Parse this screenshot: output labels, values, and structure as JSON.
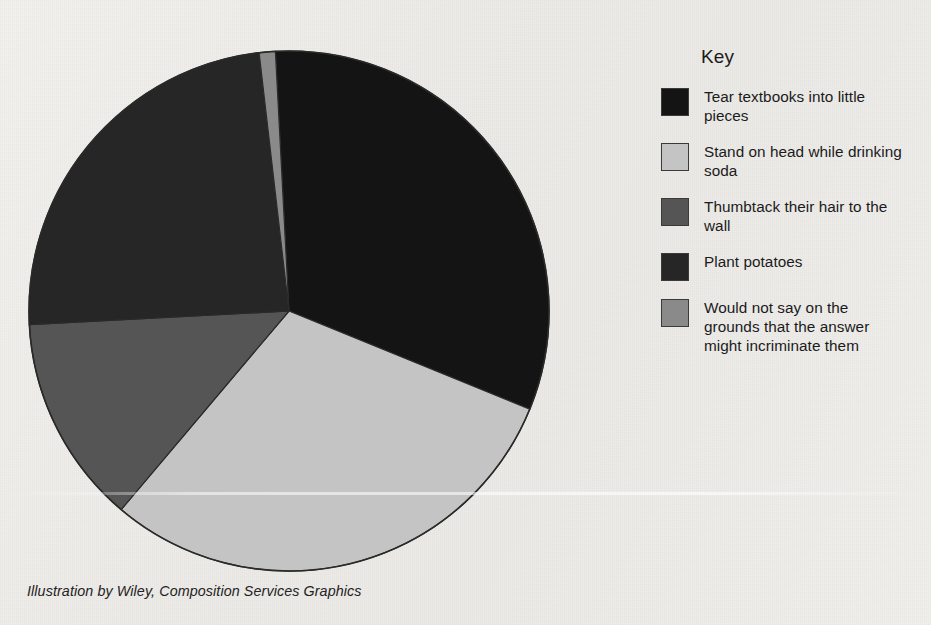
{
  "chart_data": {
    "type": "pie",
    "title": "",
    "subtitle": "",
    "xlabel": "",
    "ylabel": "",
    "legend_position": "right",
    "grid": false,
    "center": {
      "x": 289,
      "y": 311
    },
    "radius": 260,
    "start_angle_deg": -3,
    "categories": [
      "Tear textbooks into little pieces",
      "Stand on head while drinking soda",
      "Thumbtack their hair to the wall",
      "Plant potatoes",
      "Would not say on the grounds that the answer might incriminate them"
    ],
    "values": [
      32,
      30,
      13,
      24,
      1
    ],
    "colors": [
      "#141414",
      "#c4c4c4",
      "#555555",
      "#262626",
      "#8a8a8a"
    ],
    "slices": [
      {
        "label": "Tear textbooks into little pieces",
        "value": 32,
        "color": "#141414",
        "start_deg": 0,
        "sweep_deg": 115.2
      },
      {
        "label": "Stand on head while drinking soda",
        "value": 30,
        "color": "#c4c4c4",
        "start_deg": 115.2,
        "sweep_deg": 108.0
      },
      {
        "label": "Thumbtack their hair to the wall",
        "value": 13,
        "color": "#555555",
        "start_deg": 223.2,
        "sweep_deg": 46.8
      },
      {
        "label": "Plant potatoes",
        "value": 24,
        "color": "#262626",
        "start_deg": 270.0,
        "sweep_deg": 86.4
      },
      {
        "label": "Would not say on the grounds that the answer might incriminate them",
        "value": 1,
        "color": "#8a8a8a",
        "start_deg": 356.4,
        "sweep_deg": 3.6
      }
    ]
  },
  "legend": {
    "title": "Key",
    "items": [
      {
        "label": "Tear textbooks into little pieces",
        "color": "#141414"
      },
      {
        "label": "Stand on head while drinking soda",
        "color": "#c4c4c4"
      },
      {
        "label": "Thumbtack their hair to the wall",
        "color": "#555555"
      },
      {
        "label": "Plant potatoes",
        "color": "#262626"
      },
      {
        "label": "Would not say on the grounds that the answer might incriminate them",
        "color": "#8a8a8a"
      }
    ]
  },
  "caption": {
    "credit": "Illustration by Wiley, Composition Services Graphics"
  },
  "colors": {
    "background": "#efedea",
    "outline": "#2a2a2a",
    "text": "#1b1b1b"
  }
}
